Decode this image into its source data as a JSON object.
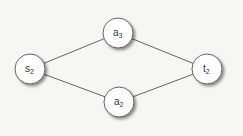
{
  "diagram": {
    "type": "graph",
    "nodes": [
      {
        "id": "s2",
        "label": "s",
        "sub": "2",
        "cx": 30,
        "cy": 69
      },
      {
        "id": "a3",
        "label": "a",
        "sub": "3",
        "cx": 118,
        "cy": 33
      },
      {
        "id": "a2",
        "label": "a",
        "sub": "2",
        "cx": 119,
        "cy": 102
      },
      {
        "id": "t2",
        "label": "t",
        "sub": "2",
        "cx": 207,
        "cy": 69
      }
    ],
    "edges": [
      {
        "from": "s2",
        "to": "a3"
      },
      {
        "from": "s2",
        "to": "a2"
      },
      {
        "from": "a3",
        "to": "t2"
      },
      {
        "from": "a2",
        "to": "t2"
      }
    ],
    "colors": {
      "edge": "#555555",
      "node_fill": "#ffffff",
      "node_stroke": "#555555",
      "shadow": "#9a9a9a"
    }
  }
}
